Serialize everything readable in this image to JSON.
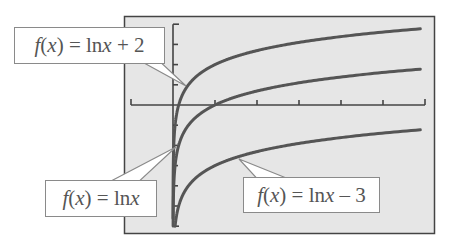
{
  "chart_data": {
    "type": "line",
    "title": "",
    "xlabel": "",
    "ylabel": "",
    "xlim": [
      -1,
      6
    ],
    "ylim": [
      -6,
      4
    ],
    "x_tick_step": 1,
    "y_tick_step": 1,
    "grid": false,
    "legend": "callout labels",
    "series": [
      {
        "name": "f(x) = ln x + 2",
        "formula": "ln(x)+2",
        "label_parts": [
          "f",
          "(",
          "x",
          ") = ln ",
          "x",
          " + 2"
        ]
      },
      {
        "name": "f(x) = ln x",
        "formula": "ln(x)",
        "label_parts": [
          "f",
          "(",
          "x",
          ") = ln ",
          "x",
          ""
        ]
      },
      {
        "name": "f(x) = ln x − 3",
        "formula": "ln(x)-3",
        "label_parts": [
          "f",
          "(",
          "x",
          ") = ln ",
          "x",
          " – 3"
        ]
      }
    ]
  },
  "colors": {
    "panel_bg": "#e6e6e6",
    "panel_border": "#444444",
    "axis": "#444444",
    "curve": "#555555",
    "label_text": "#555555"
  }
}
